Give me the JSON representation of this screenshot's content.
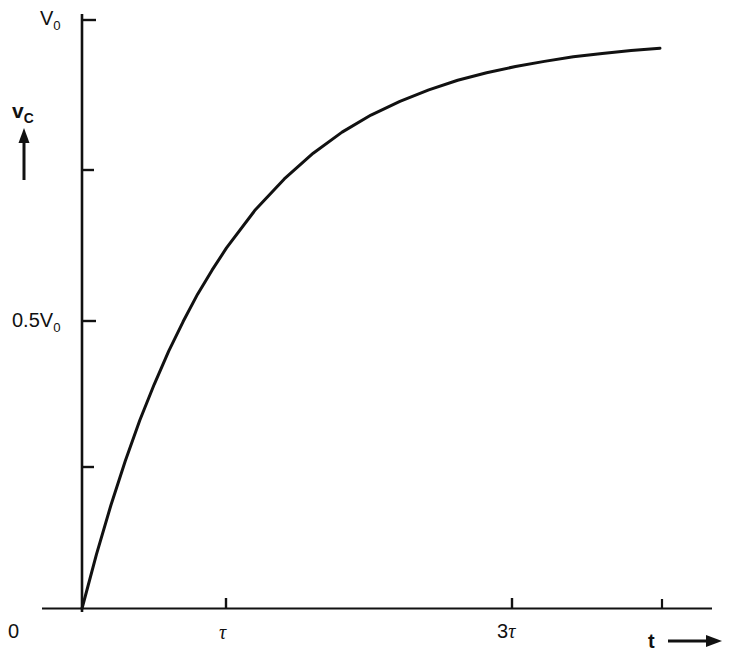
{
  "figure": {
    "kind": "line-plot",
    "background_color": "#ffffff",
    "ink_color": "#111111"
  },
  "labels": {
    "y_max": {
      "base": "V",
      "sub": "0"
    },
    "y_half": {
      "base": "0.5V",
      "sub": "0"
    },
    "y_axis_name": {
      "base": "v",
      "sub": "C"
    },
    "y_axis_arrow": "up-arrow",
    "origin": "0",
    "x_tick_1": "τ",
    "x_tick_3": {
      "num": "3",
      "tau": "τ"
    },
    "x_axis_name": "t",
    "x_axis_arrow": "right-arrow"
  },
  "chart_data": {
    "type": "line",
    "title": "",
    "subtitle": "",
    "xlabel": "t",
    "ylabel": "v_C",
    "grid": false,
    "legend": null,
    "equation": "v_C = V0 * (1 - exp(-t/tau))",
    "xlim": [
      0,
      4
    ],
    "ylim": [
      0,
      1
    ],
    "x_unit": "tau",
    "y_unit": "V0",
    "xticks": [
      {
        "value": 1,
        "label": "τ"
      },
      {
        "value": 3,
        "label": "3τ"
      },
      {
        "value": 4,
        "label": ""
      }
    ],
    "yticks": [
      {
        "value": 1.0,
        "label": "V0"
      },
      {
        "value": 0.75,
        "label": ""
      },
      {
        "value": 0.5,
        "label": "0.5V0"
      },
      {
        "value": 0.25,
        "label": ""
      }
    ],
    "series": [
      {
        "name": "capacitor voltage",
        "color": "#111111",
        "linewidth": 3,
        "x": [
          0,
          0.1,
          0.2,
          0.3,
          0.4,
          0.5,
          0.6,
          0.7,
          0.8,
          0.9,
          1.0,
          1.2,
          1.4,
          1.6,
          1.8,
          2.0,
          2.2,
          2.4,
          2.6,
          2.8,
          3.0,
          3.2,
          3.4,
          3.6,
          3.8,
          4.0
        ],
        "y": [
          0,
          0.095,
          0.181,
          0.259,
          0.33,
          0.393,
          0.451,
          0.503,
          0.551,
          0.593,
          0.632,
          0.699,
          0.753,
          0.798,
          0.835,
          0.865,
          0.889,
          0.909,
          0.926,
          0.939,
          0.95,
          0.959,
          0.967,
          0.973,
          0.978,
          0.982
        ]
      }
    ],
    "annotations": [
      {
        "text": "V0",
        "at_y": 1.0,
        "position": "left-of-axis"
      },
      {
        "text": "0.5V0",
        "at_y": 0.5,
        "position": "left-of-axis"
      },
      {
        "text": "0",
        "at_xy": [
          0,
          0
        ],
        "position": "below-left-of-origin"
      },
      {
        "text": "τ",
        "at_x": 1,
        "position": "below-axis"
      },
      {
        "text": "3τ",
        "at_x": 3,
        "position": "below-axis"
      }
    ]
  }
}
